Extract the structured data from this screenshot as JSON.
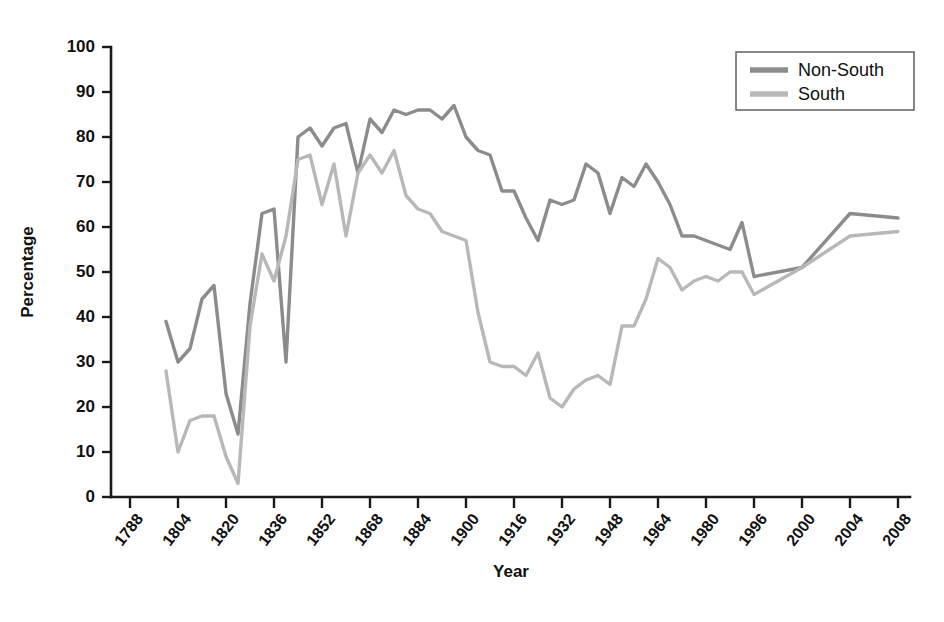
{
  "chart_data": {
    "type": "line",
    "title": "",
    "xlabel": "Year",
    "ylabel": "Percentage",
    "ylim": [
      0,
      100
    ],
    "yticks": [
      0,
      10,
      20,
      30,
      40,
      50,
      60,
      70,
      80,
      90,
      100
    ],
    "grid": false,
    "legend_position": "top-right",
    "x_tick_labels": [
      "1788",
      "1804",
      "1820",
      "1836",
      "1852",
      "1868",
      "1884",
      "1900",
      "1916",
      "1932",
      "1948",
      "1964",
      "1980",
      "1996",
      "2000",
      "2004",
      "2008"
    ],
    "legend": [
      "Non-South",
      "South"
    ],
    "colors": {
      "non_south": "#8c8c8c",
      "south": "#b8b8b8",
      "axis": "#1a1a1a"
    },
    "series": [
      {
        "name": "Non-South",
        "color": "#8c8c8c",
        "points": [
          [
            1800,
            39
          ],
          [
            1804,
            30
          ],
          [
            1808,
            33
          ],
          [
            1812,
            44
          ],
          [
            1816,
            47
          ],
          [
            1820,
            23
          ],
          [
            1824,
            14
          ],
          [
            1828,
            43
          ],
          [
            1832,
            63
          ],
          [
            1836,
            64
          ],
          [
            1840,
            30
          ],
          [
            1844,
            80
          ],
          [
            1848,
            82
          ],
          [
            1852,
            78
          ],
          [
            1856,
            82
          ],
          [
            1860,
            83
          ],
          [
            1864,
            72
          ],
          [
            1868,
            84
          ],
          [
            1872,
            81
          ],
          [
            1876,
            86
          ],
          [
            1880,
            85
          ],
          [
            1884,
            86
          ],
          [
            1888,
            86
          ],
          [
            1892,
            84
          ],
          [
            1896,
            87
          ],
          [
            1900,
            80
          ],
          [
            1904,
            77
          ],
          [
            1908,
            76
          ],
          [
            1912,
            68
          ],
          [
            1916,
            68
          ],
          [
            1920,
            62
          ],
          [
            1924,
            57
          ],
          [
            1928,
            66
          ],
          [
            1932,
            65
          ],
          [
            1936,
            66
          ],
          [
            1940,
            74
          ],
          [
            1944,
            72
          ],
          [
            1948,
            63
          ],
          [
            1952,
            71
          ],
          [
            1956,
            69
          ],
          [
            1960,
            74
          ],
          [
            1964,
            70
          ],
          [
            1968,
            65
          ],
          [
            1972,
            58
          ],
          [
            1976,
            58
          ],
          [
            1980,
            57
          ],
          [
            1984,
            56
          ],
          [
            1988,
            55
          ],
          [
            1992,
            61
          ],
          [
            1996,
            49
          ],
          [
            2000,
            51
          ],
          [
            2004,
            63
          ],
          [
            2008,
            62
          ]
        ]
      },
      {
        "name": "South",
        "color": "#b8b8b8",
        "points": [
          [
            1800,
            28
          ],
          [
            1804,
            10
          ],
          [
            1808,
            17
          ],
          [
            1812,
            18
          ],
          [
            1816,
            18
          ],
          [
            1820,
            9
          ],
          [
            1824,
            3
          ],
          [
            1828,
            38
          ],
          [
            1832,
            54
          ],
          [
            1836,
            48
          ],
          [
            1840,
            58
          ],
          [
            1844,
            75
          ],
          [
            1848,
            76
          ],
          [
            1852,
            65
          ],
          [
            1856,
            74
          ],
          [
            1860,
            58
          ],
          [
            1864,
            72
          ],
          [
            1868,
            76
          ],
          [
            1872,
            72
          ],
          [
            1876,
            77
          ],
          [
            1880,
            67
          ],
          [
            1884,
            64
          ],
          [
            1888,
            63
          ],
          [
            1892,
            59
          ],
          [
            1896,
            58
          ],
          [
            1900,
            57
          ],
          [
            1904,
            41
          ],
          [
            1908,
            30
          ],
          [
            1912,
            29
          ],
          [
            1916,
            29
          ],
          [
            1920,
            27
          ],
          [
            1924,
            32
          ],
          [
            1928,
            22
          ],
          [
            1932,
            20
          ],
          [
            1936,
            24
          ],
          [
            1940,
            26
          ],
          [
            1944,
            27
          ],
          [
            1948,
            25
          ],
          [
            1952,
            38
          ],
          [
            1956,
            38
          ],
          [
            1960,
            44
          ],
          [
            1964,
            53
          ],
          [
            1968,
            51
          ],
          [
            1972,
            46
          ],
          [
            1976,
            48
          ],
          [
            1980,
            49
          ],
          [
            1984,
            48
          ],
          [
            1988,
            50
          ],
          [
            1992,
            50
          ],
          [
            1996,
            45
          ],
          [
            2000,
            51
          ],
          [
            2004,
            58
          ],
          [
            2008,
            59
          ]
        ]
      }
    ],
    "series_break": {
      "series": "South",
      "note": "gap between 1864 and 1868"
    }
  }
}
